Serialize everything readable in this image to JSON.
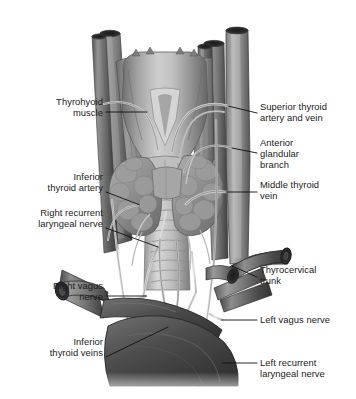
{
  "figure": {
    "background_color": "#ffffff",
    "label_color": "#1a1a1a",
    "leader_line_color": "#111111"
  },
  "labels": {
    "left": [
      {
        "id": "thyrohyoid-muscle",
        "lines": [
          "Thyrohyoid",
          "muscle"
        ],
        "text_x": 103,
        "text_y": 97,
        "leader": [
          [
            106,
            112
          ],
          [
            147,
            112
          ]
        ]
      },
      {
        "id": "inferior-thyroid-artery",
        "lines": [
          "Inferior",
          "thyroid artery"
        ],
        "text_x": 103,
        "text_y": 172,
        "leader": [
          [
            106,
            192
          ],
          [
            140,
            205
          ]
        ]
      },
      {
        "id": "right-recurrent-laryngeal-nerve",
        "lines": [
          "Right recurrent",
          "laryngeal nerve"
        ],
        "text_x": 103,
        "text_y": 208,
        "leader": [
          [
            106,
            228
          ],
          [
            158,
            247
          ]
        ]
      },
      {
        "id": "right-vagus-nerve",
        "lines": [
          "Right vagus",
          "nerve"
        ],
        "text_x": 103,
        "text_y": 281,
        "leader": [
          [
            106,
            296
          ],
          [
            146,
            296
          ]
        ]
      },
      {
        "id": "inferior-thyroid-veins",
        "lines": [
          "Inferior",
          "thyroid veins"
        ],
        "text_x": 103,
        "text_y": 337,
        "leader": [
          [
            106,
            357
          ],
          [
            168,
            327
          ]
        ]
      }
    ],
    "right": [
      {
        "id": "superior-thyroid-artery-and-vein",
        "lines": [
          "Superior thyroid",
          "artery and vein"
        ],
        "text_x": 260,
        "text_y": 102,
        "leader": [
          [
            257,
            113
          ],
          [
            228,
            106
          ]
        ]
      },
      {
        "id": "anterior-glandular-branch",
        "lines": [
          "Anterior",
          "glandular",
          "branch"
        ],
        "text_x": 260,
        "text_y": 138,
        "leader": [
          [
            257,
            153
          ],
          [
            232,
            148
          ]
        ]
      },
      {
        "id": "middle-thyroid-vein",
        "lines": [
          "Middle thyroid",
          "vein"
        ],
        "text_x": 260,
        "text_y": 180,
        "leader": [
          [
            257,
            192
          ],
          [
            226,
            192
          ]
        ]
      },
      {
        "id": "thyrocervical-trunk",
        "lines": [
          "Thyrocervical",
          "trunk"
        ],
        "text_x": 260,
        "text_y": 265,
        "leader": [
          [
            257,
            277
          ],
          [
            232,
            266
          ]
        ]
      },
      {
        "id": "left-vagus-nerve",
        "lines": [
          "Left vagus nerve"
        ],
        "text_x": 260,
        "text_y": 315,
        "leader": [
          [
            257,
            320
          ],
          [
            222,
            320
          ]
        ]
      },
      {
        "id": "left-recurrent-laryngeal-nerve",
        "lines": [
          "Left recurrent",
          "laryngeal nerve"
        ],
        "text_x": 260,
        "text_y": 358,
        "leader": [
          [
            257,
            363
          ],
          [
            222,
            363
          ]
        ]
      }
    ]
  },
  "structures": [
    {
      "name": "thyroid-cartilage",
      "label": "Thyroid cartilage / larynx"
    },
    {
      "name": "thyrohyoid-muscle",
      "label": "Thyrohyoid muscle"
    },
    {
      "name": "thyroid-gland-right-lobe",
      "label": "Right lobe of thyroid gland"
    },
    {
      "name": "thyroid-gland-left-lobe",
      "label": "Left lobe of thyroid gland"
    },
    {
      "name": "thyroid-isthmus",
      "label": "Isthmus"
    },
    {
      "name": "trachea",
      "label": "Trachea"
    },
    {
      "name": "common-carotid-artery",
      "label": "Common carotid artery"
    },
    {
      "name": "internal-jugular-vein",
      "label": "Internal jugular vein"
    },
    {
      "name": "subclavian-vessels",
      "label": "Subclavian vessels"
    },
    {
      "name": "brachiocephalic-vein",
      "label": "Brachiocephalic vein"
    },
    {
      "name": "aortic-arch",
      "label": "Aortic arch"
    }
  ]
}
